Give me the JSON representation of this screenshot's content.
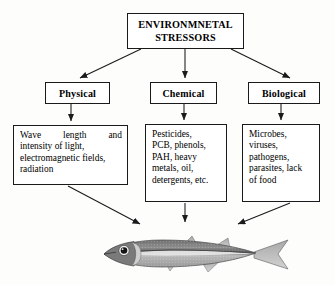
{
  "diagram": {
    "type": "flow-chart",
    "title_box": {
      "name": "environmental-stressors",
      "line1": "ENVIRONMNETAL",
      "line2": "STRESSORS"
    },
    "categories": [
      {
        "name": "physical",
        "label": "Physical"
      },
      {
        "name": "chemical",
        "label": "Chemical"
      },
      {
        "name": "biological",
        "label": "Biological"
      }
    ],
    "details": [
      {
        "name": "physical-detail",
        "lines": [
          "Wave length and",
          "intensity of light,",
          "electromagnetic fields,",
          "radiation"
        ],
        "justify_first": [
          "Wave",
          "length",
          "and"
        ]
      },
      {
        "name": "chemical-detail",
        "lines": [
          "Pesticides,",
          "PCB, phenols,",
          "PAH, heavy",
          "metals, oil,",
          "detergents, etc."
        ]
      },
      {
        "name": "biological-detail",
        "lines": [
          "Microbes,",
          "viruses,",
          "pathogens,",
          "parasites, lack",
          "of food"
        ]
      }
    ],
    "target": {
      "name": "fish-illustration",
      "label": "fish"
    },
    "colors": {
      "background": "#fdfdfc",
      "stroke": "#1a1a1a",
      "box_fill": "#ffffff",
      "fish_body": "#8d8d8d",
      "fish_dark": "#4a4a4a"
    }
  }
}
